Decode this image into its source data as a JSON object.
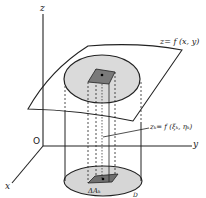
{
  "diagram": {
    "type": "double-integral-volume-illustration",
    "labels": {
      "z_axis": "z",
      "x_axis": "x",
      "y_axis": "y",
      "origin": "O",
      "surface": "z= f (x, y)",
      "sample_height": "zₖ= f (ξₖ, ηₖ)",
      "area_element": "ΔAₖ",
      "region": "D"
    },
    "colors": {
      "line": "#222222",
      "region_fill": "#d6d6d6",
      "element_fill": "#7a7a7a",
      "background": "#ffffff"
    }
  }
}
